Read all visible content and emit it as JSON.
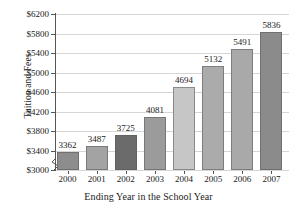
{
  "chart_data": {
    "type": "bar",
    "title": "",
    "xlabel": "Ending Year in the School Year",
    "ylabel": "Tuition and Fees",
    "categories": [
      "2000",
      "2001",
      "2002",
      "2003",
      "2004",
      "2005",
      "2006",
      "2007"
    ],
    "values": [
      3362,
      3487,
      3725,
      4081,
      4694,
      5132,
      5491,
      5836
    ],
    "value_labels": [
      "3362",
      "3487",
      "3725",
      "4081",
      "4694",
      "5132",
      "5491",
      "5836"
    ],
    "ylim": [
      3000,
      6200
    ],
    "ytick_values": [
      3000,
      3400,
      3800,
      4200,
      4600,
      5000,
      5400,
      5800,
      6200
    ],
    "ytick_labels": [
      "$3000",
      "$3400",
      "$3800",
      "$4200",
      "$4600",
      "$5000",
      "$5400",
      "$5800",
      "$6200"
    ],
    "grid": true,
    "legend": "none",
    "axis_break": true,
    "bar_colors": [
      "#8d8d8d",
      "#a3a3a3",
      "#6b6b6b",
      "#9b9b9b",
      "#c6c6c6",
      "#ababab",
      "#a9a9a9",
      "#8b8b8b"
    ],
    "colors": {
      "background": "#ffffff",
      "axis": "#555555",
      "gridline": "#d6d6d6",
      "text": "#1a1a1a"
    }
  }
}
